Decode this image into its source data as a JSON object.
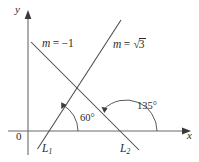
{
  "figure": {
    "type": "geometry-diagram",
    "background_color": "#ffffff",
    "line_color": "#4a4a4a",
    "axis_color": "#6b6b6b",
    "text_color": "#2b2b2b",
    "axes": {
      "y_label": "y",
      "x_label": "x",
      "origin_label": "0"
    },
    "labels": {
      "slope_l2": {
        "variable": "m",
        "equals": "=",
        "value": "−1"
      },
      "slope_l1": {
        "variable": "m",
        "equals": "=",
        "radical_symbol": "√",
        "radicand": "3"
      },
      "angle_60": "60°",
      "angle_135": "135°",
      "line_1": {
        "name": "L",
        "subscript": "1"
      },
      "line_2": {
        "name": "L",
        "subscript": "2"
      }
    },
    "lines": [
      {
        "name": "L1",
        "slope_text": "m = √3",
        "slope_value": 1.7320508,
        "inclination_degrees": 60,
        "direction": "rising-right"
      },
      {
        "name": "L2",
        "slope_text": "m = −1",
        "slope_value": -1,
        "inclination_degrees": 135,
        "direction": "falling-right"
      }
    ],
    "angles": [
      {
        "label": "60°",
        "vertex": "x-intercept of L1",
        "measured_from": "positive x-axis",
        "line": "L1"
      },
      {
        "label": "135°",
        "vertex": "x-intercept of L2",
        "measured_from": "positive x-axis",
        "line": "L2"
      }
    ]
  }
}
